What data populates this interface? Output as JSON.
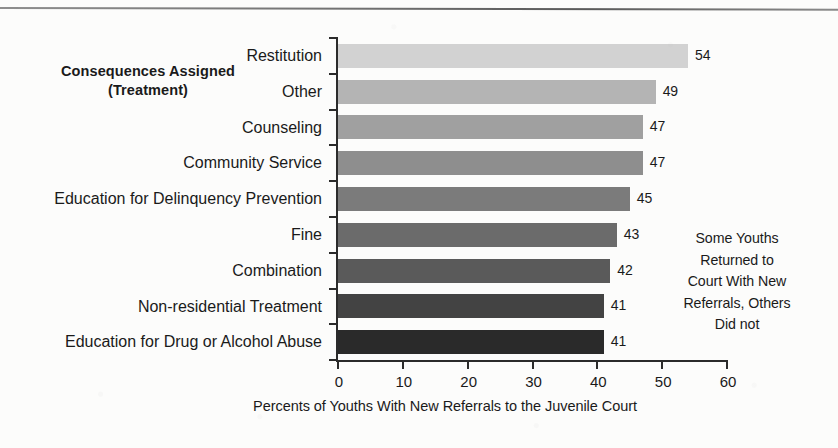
{
  "title": {
    "line1": "Consequences Assigned",
    "line2": "(Treatment)"
  },
  "annotation": {
    "lines": [
      "Some Youths",
      "Returned to",
      "Court With New",
      "Referrals, Others",
      "Did not"
    ]
  },
  "chart_data": {
    "type": "bar",
    "orientation": "horizontal",
    "title": "Consequences Assigned (Treatment)",
    "categories": [
      "Restitution",
      "Other",
      "Counseling",
      "Community Service",
      "Education for Delinquency Prevention",
      "Fine",
      "Combination",
      "Non-residential Treatment",
      "Education for Drug or Alcohol Abuse"
    ],
    "values": [
      54,
      49,
      47,
      47,
      45,
      43,
      42,
      41,
      41
    ],
    "bar_colors": [
      "#d2d2d2",
      "#b4b4b4",
      "#a0a0a0",
      "#8e8e8e",
      "#7b7b7b",
      "#6b6b6b",
      "#5a5a5a",
      "#434343",
      "#2a2a2a"
    ],
    "xlabel": "Percents of Youths With New Referrals to the Juvenile Court",
    "ylabel": "",
    "xlim": [
      0,
      60
    ],
    "xticks": [
      0,
      10,
      20,
      30,
      40,
      50,
      60
    ],
    "xtick_labels": [
      "0",
      "10",
      "20",
      "30",
      "40",
      "50",
      "60"
    ],
    "grid": false,
    "legend": false,
    "value_labels_shown": true
  }
}
